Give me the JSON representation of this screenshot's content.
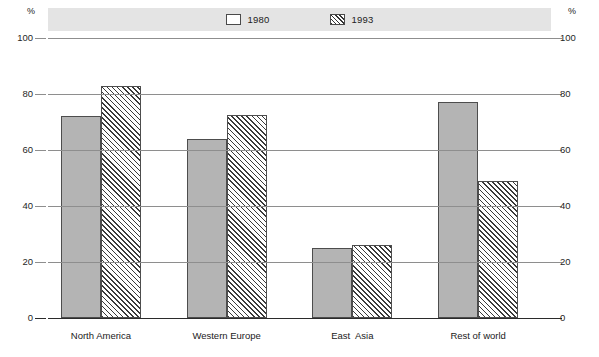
{
  "axis": {
    "unit_symbol": "%",
    "ticks": [
      100,
      80,
      60,
      40,
      20,
      0
    ],
    "min": 0,
    "max": 100
  },
  "legend": {
    "entries": [
      {
        "label": "1980",
        "swatch": "solid-gray-swatch"
      },
      {
        "label": "1993",
        "swatch": "diagonal-hatch-swatch"
      }
    ]
  },
  "chart_data": {
    "type": "bar",
    "title": "",
    "subtitle": "",
    "xlabel": "",
    "ylabel": "%",
    "ylim": [
      0,
      100
    ],
    "yticks": [
      0,
      20,
      40,
      60,
      80,
      100
    ],
    "grid": true,
    "legend_position": "top-center",
    "categories": [
      "North America",
      "Western Europe",
      "East  Asia",
      "Rest of world"
    ],
    "series": [
      {
        "name": "1980",
        "values": [
          72,
          64,
          25,
          77
        ]
      },
      {
        "name": "1993",
        "values": [
          83,
          72.5,
          26,
          49
        ]
      }
    ]
  }
}
